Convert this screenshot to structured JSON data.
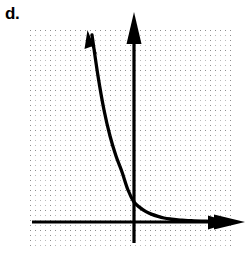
{
  "label": {
    "text": "d."
  },
  "chart_data": {
    "type": "line",
    "title": "",
    "subtitle": "",
    "xlabel": "",
    "ylabel": "",
    "function": "y = a*b^x, 0 < b < 1 (exponential decay)",
    "grid": true,
    "grid_major_spacing": 20,
    "grid_minor_spacing": 5,
    "axis_color": "#000000",
    "curve_color": "#000000",
    "grid_color": "#b9b9b9",
    "grid_major_color": "#8e8e8e",
    "background_color": "#ffffff",
    "xlim": [
      -5.2,
      5.05
    ],
    "ylim": [
      -1.3,
      9.6
    ],
    "x_axis_pixel_y": 222,
    "y_axis_pixel_x": 134,
    "y_intercept": 1.0,
    "horizontal_asymptote": 0,
    "arrowheads": {
      "x_axis_right": true,
      "x_axis_left": false,
      "y_axis_up": true,
      "y_axis_down": false,
      "curve_upper_left": true,
      "curve_lower_right": true
    },
    "x": [
      -2.1,
      -1.8,
      -1.5,
      -1.2,
      -0.9,
      -0.6,
      -0.3,
      0.0,
      0.3,
      0.6,
      0.9,
      1.2,
      1.5,
      1.8,
      2.1,
      2.4,
      2.7,
      3.0,
      3.6,
      4.2,
      4.6
    ],
    "values": [
      9.35,
      7.3,
      5.6,
      4.3,
      3.3,
      2.5,
      1.6,
      1.0,
      0.72,
      0.52,
      0.38,
      0.28,
      0.2,
      0.15,
      0.12,
      0.09,
      0.07,
      0.06,
      0.04,
      0.03,
      0.02
    ],
    "series": [
      {
        "name": "exponential-decay",
        "values": [
          9.35,
          7.3,
          5.6,
          4.3,
          3.3,
          2.5,
          1.6,
          1.0,
          0.72,
          0.52,
          0.38,
          0.28,
          0.2,
          0.15,
          0.12,
          0.09,
          0.07,
          0.06,
          0.04,
          0.03,
          0.02
        ]
      }
    ],
    "legend": [],
    "legend_position": "none",
    "tick_labels_x": [],
    "tick_labels_y": [],
    "annotations": []
  }
}
